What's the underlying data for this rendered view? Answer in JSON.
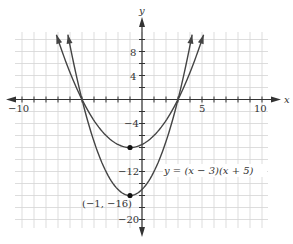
{
  "chart_data": {
    "type": "line",
    "title": "",
    "xlabel": "x",
    "ylabel": "y",
    "xlim": [
      -10.5,
      10.5
    ],
    "ylim": [
      -21,
      11
    ],
    "grid": true,
    "x_grid_step": 1,
    "y_grid_step": 2,
    "x_tick_labels": [
      "-10",
      "5",
      "10"
    ],
    "y_tick_labels": [
      "8",
      "4",
      "-4",
      "-12",
      "-20"
    ],
    "series": [
      {
        "name": "y = (x − 3)(x + 5)",
        "a": 1,
        "roots": [
          -5,
          3
        ],
        "vertex": [
          -1,
          -16
        ]
      },
      {
        "name": "inner parabola",
        "a": 0.5,
        "roots": [
          -5,
          3
        ],
        "vertex": [
          -1,
          -8
        ]
      }
    ],
    "points": [
      {
        "x": -1,
        "y": -16,
        "label": "(−1, −16)"
      },
      {
        "x": -1,
        "y": -8,
        "label": ""
      }
    ],
    "annotations": [
      {
        "text": "y = (x − 3)(x + 5)",
        "x": 0.6,
        "y": -12.5
      }
    ]
  },
  "labels": {
    "x_axis": "x",
    "y_axis": "y",
    "tick_x_neg10": "−10",
    "tick_x_5": "5",
    "tick_x_10": "10",
    "tick_y_8": "8",
    "tick_y_4": "4",
    "tick_y_neg4": "−4",
    "tick_y_neg12": "−12",
    "tick_y_neg20": "−20",
    "equation": "y = (x − 3)(x + 5)",
    "vertex_label": "(−1, −16)"
  },
  "colors": {
    "grid": "#d4d4d4",
    "axis": "#333333",
    "curve": "#444444"
  }
}
